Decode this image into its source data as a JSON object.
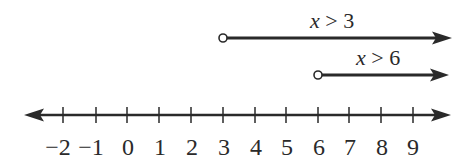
{
  "diagram": {
    "type": "number-line-inequalities",
    "axis": {
      "ticks": [
        -2,
        -1,
        0,
        1,
        2,
        3,
        4,
        5,
        6,
        7,
        8,
        9
      ],
      "tick_labels": [
        "−2",
        "−1",
        "0",
        "1",
        "2",
        "3",
        "4",
        "5",
        "6",
        "7",
        "8",
        "9"
      ],
      "arrows": "both"
    },
    "rays": [
      {
        "label_var": "x",
        "label_op": " > ",
        "label_val": "3",
        "start": 3,
        "endpoint": "open",
        "direction": "right"
      },
      {
        "label_var": "x",
        "label_op": " > ",
        "label_val": "6",
        "start": 6,
        "endpoint": "open",
        "direction": "right"
      }
    ],
    "colors": {
      "line": "#2a2a2a",
      "background": "#ffffff"
    }
  }
}
